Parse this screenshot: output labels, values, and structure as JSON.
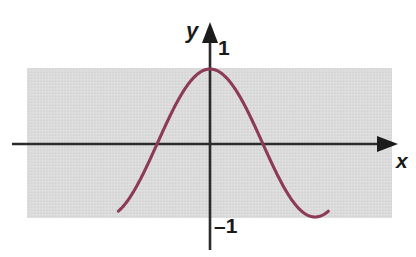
{
  "figure": {
    "kind": "cosine-graph",
    "background_color": "#ffffff",
    "band_color": "#d8d8d8",
    "axis_color": "#2b2b2b",
    "curve_color": "#8c3a56",
    "labels": {
      "y_axis": "y",
      "x_axis": "x",
      "y_max_tick": "1",
      "y_min_tick": "–1"
    }
  },
  "chart_data": {
    "type": "line",
    "title": "",
    "xlabel": "x",
    "ylabel": "y",
    "grid": false,
    "legend": null,
    "series": [
      {
        "name": "cos(x)",
        "color": "#8c3a56",
        "x": [
          -2.74,
          -2.54,
          -2.34,
          -2.14,
          -1.94,
          -1.74,
          -1.54,
          -1.34,
          -1.14,
          -0.94,
          -0.74,
          -0.54,
          -0.34,
          -0.14,
          0.0,
          0.14,
          0.34,
          0.54,
          0.74,
          0.94,
          1.14,
          1.34,
          1.54,
          1.74,
          1.94,
          2.14,
          2.34,
          2.54,
          2.74,
          2.94,
          3.14,
          3.34,
          3.54
        ],
        "y": [
          -0.92,
          -0.82,
          -0.69,
          -0.54,
          -0.36,
          -0.17,
          0.03,
          0.23,
          0.41,
          0.59,
          0.74,
          0.86,
          0.94,
          0.99,
          1.0,
          0.99,
          0.94,
          0.86,
          0.74,
          0.59,
          0.41,
          0.23,
          0.03,
          -0.17,
          -0.36,
          -0.54,
          -0.69,
          -0.82,
          -0.92,
          -0.98,
          -1.0,
          -0.98,
          -0.92
        ]
      }
    ],
    "xlim": [
      -2.74,
      3.54
    ],
    "ylim": [
      -1,
      1
    ],
    "ytick_labels": [
      "1",
      "–1"
    ],
    "ytick_values": [
      1,
      -1
    ],
    "annotations": [
      {
        "text": "1",
        "x": 0,
        "y": 1
      },
      {
        "text": "–1",
        "x": 0,
        "y": -1
      }
    ]
  }
}
